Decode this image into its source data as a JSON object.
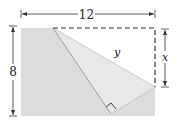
{
  "diagram": {
    "type": "folded-rectangle",
    "width_label": "12",
    "height_label": "8",
    "fold_edge_label": "y",
    "segment_label": "x",
    "colors": {
      "paper": "#dcdcdc",
      "folded_flap": "#e6e6e6",
      "line": "#333333"
    }
  }
}
